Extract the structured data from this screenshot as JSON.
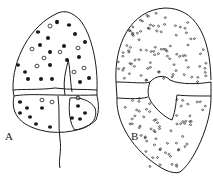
{
  "figure": {
    "panels": [
      {
        "label": "A",
        "description": "dinoflagellate cell, ventral view with scattered dots"
      },
      {
        "label": "B",
        "description": "dinoflagellate cell, densely dotted theca"
      }
    ]
  },
  "colors": {
    "ink": "#1a1a1a",
    "background": "#ffffff"
  }
}
